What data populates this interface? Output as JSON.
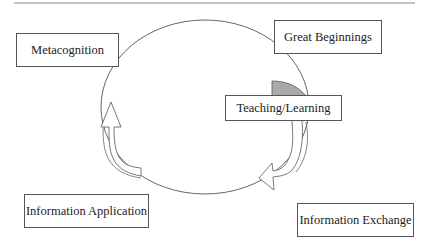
{
  "diagram": {
    "type": "cycle",
    "nodes": [
      {
        "id": "metacognition",
        "label": "Metacognition"
      },
      {
        "id": "great_beginnings",
        "label": "Great Beginnings"
      },
      {
        "id": "teaching_learning",
        "label": "Teaching/Learning"
      },
      {
        "id": "information_application",
        "label": "Information Application"
      },
      {
        "id": "information_exchange",
        "label": "Information Exchange"
      }
    ],
    "edges": [
      {
        "from": "great_beginnings",
        "to": "teaching_learning"
      },
      {
        "from": "teaching_learning",
        "to": "information_exchange"
      },
      {
        "from": "information_exchange",
        "to": "information_application"
      },
      {
        "from": "information_application",
        "to": "metacognition"
      },
      {
        "from": "metacognition",
        "to": "great_beginnings"
      }
    ],
    "colors": {
      "stroke": "#555555",
      "highlight_fill": "#aaaaaa",
      "background": "#ffffff",
      "rule": "#888888"
    }
  }
}
